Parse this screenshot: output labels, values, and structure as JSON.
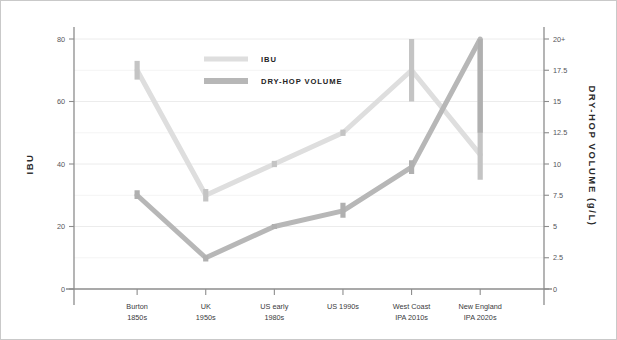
{
  "chart_data": {
    "type": "line",
    "title": "",
    "subtitle": "",
    "categories": [
      "Burton\n1850s",
      "UK\n1950s",
      "US early\n1980s",
      "US 1990s",
      "West Coast\nIPA 2010s",
      "New England\nIPA 2020s"
    ],
    "category_lines": [
      [
        "Burton",
        "1850s"
      ],
      [
        "UK",
        "1950s"
      ],
      [
        "US early",
        "1980s"
      ],
      [
        "US 1990s",
        ""
      ],
      [
        "West Coast",
        "IPA 2010s"
      ],
      [
        "New England",
        "IPA 2020s"
      ]
    ],
    "series": [
      {
        "name": "IBU",
        "axis": "left",
        "color": "#dedede",
        "values": [
          70,
          30,
          40,
          50,
          70,
          43
        ],
        "ranges": [
          [
            67,
            73
          ],
          [
            28,
            32
          ],
          [
            39,
            41
          ],
          [
            49,
            51
          ],
          [
            60,
            80
          ],
          [
            35,
            80
          ]
        ]
      },
      {
        "name": "DRY-HOP VOLUME",
        "axis": "right",
        "color": "#b7b7b7",
        "values": [
          7.5,
          2.5,
          5,
          6.25,
          9.75,
          20
        ],
        "ranges": [
          [
            7.2,
            7.9
          ],
          [
            2.2,
            2.7
          ],
          [
            4.8,
            5.2
          ],
          [
            5.7,
            6.9
          ],
          [
            9.2,
            10.3
          ],
          [
            12.5,
            20
          ]
        ]
      }
    ],
    "left_axis": {
      "label": "IBU",
      "ticks": [
        0,
        20,
        40,
        60,
        80
      ],
      "tick_labels": [
        "0",
        "20",
        "40",
        "60",
        "80"
      ],
      "minor_ticks": [
        10,
        30,
        50,
        70
      ],
      "min": 0,
      "max": 80
    },
    "right_axis": {
      "label": "DRY-HOP VOLUME (g/L)",
      "ticks": [
        0,
        2.5,
        5,
        7.5,
        10,
        12.5,
        15,
        17.5,
        20
      ],
      "tick_labels": [
        "0",
        "2.5",
        "5",
        "7.5",
        "10",
        "12.5",
        "15",
        "17.5",
        "20+"
      ],
      "min": 0,
      "max": 20
    },
    "legend": {
      "position": "top-center",
      "entries": [
        {
          "label": "IBU",
          "color": "#dedede"
        },
        {
          "label": "DRY-HOP VOLUME",
          "color": "#b7b7b7"
        }
      ]
    },
    "grid": true,
    "xlabel": "",
    "ylabel": "IBU"
  }
}
